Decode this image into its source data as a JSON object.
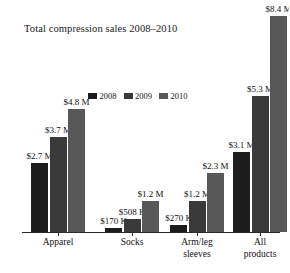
{
  "chart_data": {
    "type": "bar",
    "title": "Total compression sales 2008–2010",
    "xlabel": "",
    "ylabel": "",
    "grid": false,
    "legend_position": "center",
    "ylim": [
      0,
      9.2
    ],
    "categories": [
      "Apparel",
      "Socks",
      "Arm/leg sleeves",
      "All products"
    ],
    "series": [
      {
        "name": "2008",
        "color": "#1c1c1c",
        "values": [
          2.7,
          0.17,
          0.27,
          3.1
        ],
        "labels": [
          "$2.7 M",
          "$170 K",
          "$270 K",
          "$3.1 M"
        ]
      },
      {
        "name": "2009",
        "color": "#3a3a3a",
        "values": [
          3.7,
          0.508,
          1.2,
          5.3
        ],
        "labels": [
          "$3.7 M",
          "$508 K",
          "$1.2 M",
          "$5.3 M"
        ]
      },
      {
        "name": "2010",
        "color": "#585858",
        "values": [
          4.8,
          1.2,
          2.3,
          8.4
        ],
        "labels": [
          "$4.8 M",
          "$1.2 M",
          "$2.3 M",
          "$8.4 M"
        ]
      }
    ]
  },
  "title": "Total compression sales 2008–2010",
  "legend": {
    "items": [
      {
        "label": "2008",
        "color": "#1c1c1c"
      },
      {
        "label": "2009",
        "color": "#3a3a3a"
      },
      {
        "label": "2010",
        "color": "#585858"
      }
    ]
  },
  "axis": {
    "categories": [
      {
        "line1": "Apparel",
        "line2": ""
      },
      {
        "line1": "Socks",
        "line2": ""
      },
      {
        "line1": "Arm/leg",
        "line2": "sleeves"
      },
      {
        "line1": "All",
        "line2": "products"
      }
    ]
  },
  "bars": [
    {
      "group": 0,
      "series": 0,
      "label": "$2.7 M",
      "value": 2.7,
      "color": "#1c1c1c"
    },
    {
      "group": 0,
      "series": 1,
      "label": "$3.7 M",
      "value": 3.7,
      "color": "#3a3a3a"
    },
    {
      "group": 0,
      "series": 2,
      "label": "$4.8 M",
      "value": 4.8,
      "color": "#585858"
    },
    {
      "group": 1,
      "series": 0,
      "label": "$170 K",
      "value": 0.17,
      "color": "#1c1c1c"
    },
    {
      "group": 1,
      "series": 1,
      "label": "$508 K",
      "value": 0.508,
      "color": "#3a3a3a"
    },
    {
      "group": 1,
      "series": 2,
      "label": "$1.2 M",
      "value": 1.2,
      "color": "#585858"
    },
    {
      "group": 2,
      "series": 0,
      "label": "$270 K",
      "value": 0.27,
      "color": "#1c1c1c"
    },
    {
      "group": 2,
      "series": 1,
      "label": "$1.2 M",
      "value": 1.2,
      "color": "#3a3a3a"
    },
    {
      "group": 2,
      "series": 2,
      "label": "$2.3 M",
      "value": 2.3,
      "color": "#585858"
    },
    {
      "group": 3,
      "series": 0,
      "label": "$3.1 M",
      "value": 3.1,
      "color": "#1c1c1c"
    },
    {
      "group": 3,
      "series": 1,
      "label": "$5.3 M",
      "value": 5.3,
      "color": "#3a3a3a"
    },
    {
      "group": 3,
      "series": 2,
      "label": "$8.4 M",
      "value": 8.4,
      "color": "#585858"
    }
  ]
}
